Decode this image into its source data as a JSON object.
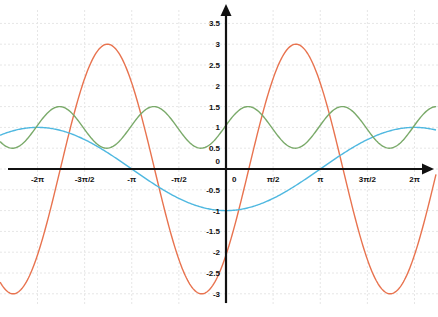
{
  "chart_data": {
    "type": "line",
    "title": "",
    "xlabel": "",
    "ylabel": "",
    "xlim": [
      -7.53,
      7.0
    ],
    "ylim": [
      -3.2,
      3.9
    ],
    "grid": true,
    "legend": null,
    "x_ticks": [
      {
        "value": -6.2832,
        "label": "-2π"
      },
      {
        "value": -4.7124,
        "label": "-3π/2"
      },
      {
        "value": -3.1416,
        "label": "-π"
      },
      {
        "value": -1.5708,
        "label": "-π/2"
      },
      {
        "value": 0,
        "label": "0"
      },
      {
        "value": 1.5708,
        "label": "π/2"
      },
      {
        "value": 3.1416,
        "label": "π"
      },
      {
        "value": 4.7124,
        "label": "3π/2"
      },
      {
        "value": 6.2832,
        "label": "2π"
      }
    ],
    "y_ticks": [
      {
        "value": 3.5,
        "label": "3.5"
      },
      {
        "value": 3,
        "label": "3"
      },
      {
        "value": 2.5,
        "label": "2.5"
      },
      {
        "value": 2,
        "label": "2"
      },
      {
        "value": 1.5,
        "label": "1.5"
      },
      {
        "value": 1,
        "label": "1"
      },
      {
        "value": 0.5,
        "label": "0.5"
      },
      {
        "value": 0,
        "label": "0"
      },
      {
        "value": -0.5,
        "label": "-0.5"
      },
      {
        "value": -1,
        "label": "-1"
      },
      {
        "value": -1.5,
        "label": "-1.5"
      },
      {
        "value": -2,
        "label": "-2"
      },
      {
        "value": -2.5,
        "label": "-2.5"
      },
      {
        "value": -3,
        "label": "-3"
      }
    ],
    "series": [
      {
        "name": "red curve (≈ 3·sin(x − π/4))",
        "color": "#e8734f",
        "amplitude": 3,
        "frequency": 1,
        "phase": -0.76,
        "offset": 0,
        "key_points": [
          [
            -7.27,
            -3
          ],
          [
            -5.52,
            0
          ],
          [
            -3.97,
            3
          ],
          [
            -2.38,
            0
          ],
          [
            -0.81,
            -3
          ],
          [
            0,
            -2.07
          ],
          [
            0.76,
            0
          ],
          [
            2.33,
            3
          ],
          [
            3.9,
            0
          ],
          [
            5.47,
            -3
          ],
          [
            6.9,
            -0.5
          ]
        ]
      },
      {
        "name": "blue curve (≈ −cos(x/2))",
        "color": "#4fb8e0",
        "amplitude": -1,
        "frequency": 0.5,
        "phase": 0,
        "offset": 0,
        "key_points": [
          [
            -7.2,
            0.9
          ],
          [
            -6.28,
            1
          ],
          [
            -3.14,
            0
          ],
          [
            0,
            -1
          ],
          [
            3.14,
            0
          ],
          [
            6.28,
            1
          ],
          [
            7.0,
            0.93
          ]
        ]
      },
      {
        "name": "green curve (≈ 1 + 0.5·sin(2x + 0.1))",
        "color": "#7aaa6a",
        "amplitude": 0.5,
        "frequency": 2,
        "phase": 0.1,
        "offset": 1,
        "key_points": [
          [
            -5.6,
            1.5
          ],
          [
            -4.0,
            0.5
          ],
          [
            -2.5,
            1.5
          ],
          [
            -0.9,
            0.5
          ],
          [
            0,
            1.05
          ],
          [
            0.73,
            1.5
          ],
          [
            2.3,
            0.5
          ],
          [
            3.9,
            1.5
          ],
          [
            5.4,
            0.5
          ],
          [
            7.0,
            1.45
          ]
        ]
      }
    ]
  }
}
